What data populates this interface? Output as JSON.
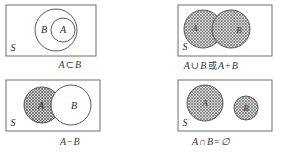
{
  "figure": {
    "universe_label": "S",
    "set_a_label": "A",
    "set_b_label": "B",
    "colors": {
      "outline": "#6e6e6e",
      "circle_stroke": "#4a4a4a",
      "hatch": "#7a7a7a",
      "hatch_background": "#d8d8d8",
      "text": "#2b2b2b",
      "page_background": "#ffffff"
    }
  },
  "panels": [
    {
      "id": "subset",
      "position": "top-left",
      "universe_label": "S",
      "caption": "A ⊂ B",
      "caption_parts": {
        "left": "A",
        "operator": "⊂",
        "right": "B",
        "alt_prefix": "",
        "alt_left": "",
        "alt_operator": "",
        "alt_right": ""
      },
      "relation": "A is a subset of B",
      "circles": [
        {
          "label": "B",
          "shaded": false,
          "cx": 56,
          "cy": 30,
          "r": 21,
          "label_x": 44,
          "label_y": 26
        },
        {
          "label": "A",
          "shaded": false,
          "cx": 63,
          "cy": 30,
          "r": 12,
          "label_x": 63,
          "label_y": 26
        }
      ]
    },
    {
      "id": "union",
      "position": "top-right",
      "universe_label": "S",
      "caption": "A ∪ B 或 A + B",
      "caption_parts": {
        "left": "A",
        "operator": "∪",
        "right": "B",
        "alt_prefix": "或",
        "alt_left": "A",
        "alt_operator": "+",
        "alt_right": "B"
      },
      "relation": "Union of A and B (A plus B)",
      "circles": [
        {
          "label": "A",
          "shaded": true,
          "cx": 48,
          "cy": 29,
          "r": 19,
          "label_x": 40,
          "label_y": 27
        },
        {
          "label": "B",
          "shaded": true,
          "cx": 76,
          "cy": 29,
          "r": 19,
          "label_x": 83,
          "label_y": 29
        }
      ]
    },
    {
      "id": "difference",
      "position": "bottom-left",
      "universe_label": "S",
      "caption": "A − B",
      "caption_parts": {
        "left": "A",
        "operator": "−",
        "right": "B",
        "alt_prefix": "",
        "alt_left": "",
        "alt_operator": "",
        "alt_right": ""
      },
      "relation": "A minus B (difference)",
      "circles": [
        {
          "label": "A",
          "shaded": true,
          "cx": 42,
          "cy": 28,
          "r": 18,
          "label_x": 41,
          "label_y": 29
        },
        {
          "label": "B",
          "shaded": false,
          "cx": 71,
          "cy": 28,
          "r": 20,
          "label_x": 74,
          "label_y": 29
        }
      ]
    },
    {
      "id": "disjoint",
      "position": "bottom-right",
      "universe_label": "S",
      "caption": "A ∩ B = ∅",
      "caption_parts": {
        "left": "A",
        "operator": "∩",
        "right": "B",
        "alt_prefix": "=",
        "alt_left": "∅",
        "alt_operator": "",
        "alt_right": ""
      },
      "relation": "Intersection of A and B is the empty set",
      "circles": [
        {
          "label": "A",
          "shaded": true,
          "cx": 46,
          "cy": 26,
          "r": 18,
          "label_x": 46,
          "label_y": 27
        },
        {
          "label": "B",
          "shaded": true,
          "cx": 87,
          "cy": 31,
          "r": 12,
          "label_x": 87,
          "label_y": 32
        }
      ]
    }
  ]
}
